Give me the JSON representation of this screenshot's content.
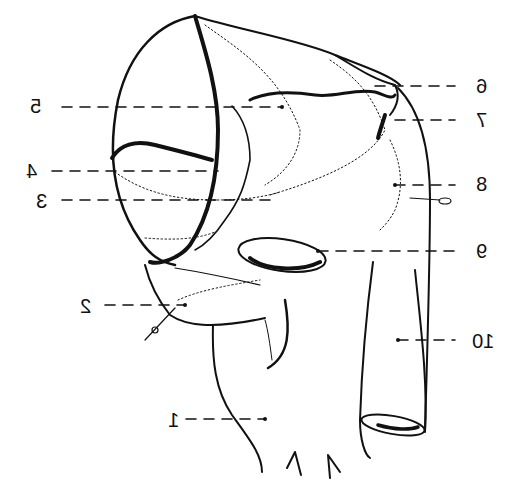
{
  "diagram": {
    "type": "anatomical line drawing (mirrored horizontally)",
    "labels": [
      {
        "id": "1",
        "text": "1",
        "x": 168,
        "y": 410
      },
      {
        "id": "2",
        "text": "2",
        "x": 80,
        "y": 296
      },
      {
        "id": "3",
        "text": "3",
        "x": 36,
        "y": 191
      },
      {
        "id": "4",
        "text": "4",
        "x": 26,
        "y": 161
      },
      {
        "id": "5",
        "text": "5",
        "x": 30,
        "y": 96
      },
      {
        "id": "6",
        "text": "6",
        "x": 476,
        "y": 76
      },
      {
        "id": "7",
        "text": "7",
        "x": 476,
        "y": 110
      },
      {
        "id": "8",
        "text": "8",
        "x": 476,
        "y": 174
      },
      {
        "id": "9",
        "text": "9",
        "x": 476,
        "y": 241
      },
      {
        "id": "10",
        "text": "10",
        "x": 472,
        "y": 331
      }
    ]
  }
}
